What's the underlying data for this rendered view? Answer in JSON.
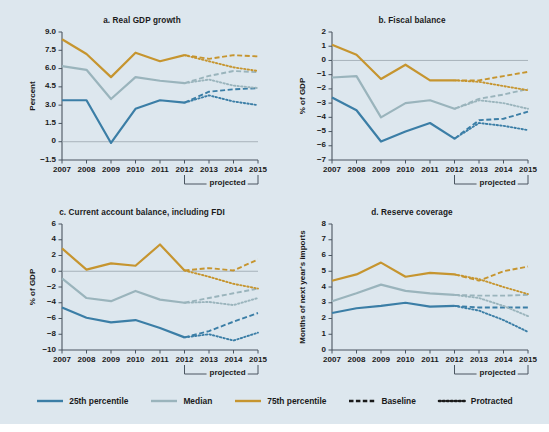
{
  "figure": {
    "background_color": "#dde7ee",
    "x_years": [
      2007,
      2008,
      2009,
      2010,
      2011,
      2012,
      2013,
      2014,
      2015
    ],
    "projected_label": "projected",
    "projected_span": [
      2012,
      2015
    ]
  },
  "colors": {
    "p25": "#3b7ea6",
    "median": "#9ab4bc",
    "p75": "#c6952f",
    "axis": "#4a5560",
    "zero_line": "#9aa6ae",
    "text": "#1a1a1a"
  },
  "legend": {
    "items": [
      {
        "label": "25th percentile",
        "style": "solid",
        "color_key": "p25",
        "color": "#3b7ea6"
      },
      {
        "label": "Median",
        "style": "solid",
        "color_key": "median",
        "color": "#9ab4bc"
      },
      {
        "label": "75th percentile",
        "style": "solid",
        "color_key": "p75",
        "color": "#c6952f"
      },
      {
        "label": "Baseline",
        "style": "dashed",
        "color_key": "black",
        "color": "#1a1a1a"
      },
      {
        "label": "Protracted",
        "style": "dotted",
        "color_key": "black",
        "color": "#1a1a1a"
      }
    ]
  },
  "chart_data": [
    {
      "id": "panel-a",
      "type": "line",
      "title": "a. Real GDP growth",
      "xlabel": "",
      "ylabel": "Percent",
      "x": [
        2007,
        2008,
        2009,
        2010,
        2011,
        2012,
        2013,
        2014,
        2015
      ],
      "ylim": [
        -1.5,
        9.0
      ],
      "yticks": [
        9.0,
        7.5,
        6.0,
        4.5,
        3.0,
        1.5,
        0,
        -1.5
      ],
      "yticklabels": [
        "9.0",
        "7.5",
        "6.0",
        "4.5",
        "3.0",
        "1.5",
        "0",
        "−1.5"
      ],
      "zero_line": 0,
      "grid": false,
      "series": [
        {
          "name": "25th percentile",
          "style": "solid",
          "color": "#3b7ea6",
          "x": [
            2007,
            2008,
            2009,
            2010,
            2011,
            2012
          ],
          "values": [
            3.4,
            3.4,
            -0.1,
            2.7,
            3.4,
            3.2
          ]
        },
        {
          "name": "Median",
          "style": "solid",
          "color": "#9ab4bc",
          "x": [
            2007,
            2008,
            2009,
            2010,
            2011,
            2012
          ],
          "values": [
            6.2,
            5.9,
            3.5,
            5.3,
            5.0,
            4.8
          ]
        },
        {
          "name": "75th percentile",
          "style": "solid",
          "color": "#c6952f",
          "x": [
            2007,
            2008,
            2009,
            2010,
            2011,
            2012
          ],
          "values": [
            8.4,
            7.2,
            5.3,
            7.3,
            6.6,
            7.1
          ]
        },
        {
          "name": "25th percentile - Baseline",
          "style": "dashed",
          "color": "#3b7ea6",
          "x": [
            2012,
            2013,
            2014,
            2015
          ],
          "values": [
            3.2,
            4.1,
            4.3,
            4.4
          ]
        },
        {
          "name": "25th percentile - Protracted",
          "style": "dotted",
          "color": "#3b7ea6",
          "x": [
            2012,
            2013,
            2014,
            2015
          ],
          "values": [
            3.2,
            3.8,
            3.3,
            3.0
          ]
        },
        {
          "name": "Median - Baseline",
          "style": "dashed",
          "color": "#9ab4bc",
          "x": [
            2012,
            2013,
            2014,
            2015
          ],
          "values": [
            4.8,
            5.4,
            5.8,
            5.7
          ]
        },
        {
          "name": "Median - Protracted",
          "style": "dotted",
          "color": "#9ab4bc",
          "x": [
            2012,
            2013,
            2014,
            2015
          ],
          "values": [
            4.8,
            5.1,
            4.6,
            4.4
          ]
        },
        {
          "name": "75th percentile - Baseline",
          "style": "dashed",
          "color": "#c6952f",
          "x": [
            2012,
            2013,
            2014,
            2015
          ],
          "values": [
            7.1,
            6.8,
            7.1,
            7.0
          ]
        },
        {
          "name": "75th percentile - Protracted",
          "style": "dotted",
          "color": "#c6952f",
          "x": [
            2012,
            2013,
            2014,
            2015
          ],
          "values": [
            7.1,
            6.6,
            6.1,
            5.8
          ]
        }
      ]
    },
    {
      "id": "panel-b",
      "type": "line",
      "title": "b. Fiscal balance",
      "xlabel": "",
      "ylabel": "% of GDP",
      "x": [
        2007,
        2008,
        2009,
        2010,
        2011,
        2012,
        2013,
        2014,
        2015
      ],
      "ylim": [
        -7,
        2
      ],
      "yticks": [
        2,
        1,
        0,
        -1,
        -2,
        -3,
        -4,
        -5,
        -6,
        -7
      ],
      "yticklabels": [
        "2",
        "1",
        "0",
        "−1",
        "−2",
        "−3",
        "−4",
        "−5",
        "−6",
        "−7"
      ],
      "zero_line": 0,
      "grid": false,
      "series": [
        {
          "name": "25th percentile",
          "style": "solid",
          "color": "#3b7ea6",
          "x": [
            2007,
            2008,
            2009,
            2010,
            2011,
            2012
          ],
          "values": [
            -2.6,
            -3.5,
            -5.7,
            -5.0,
            -4.4,
            -5.5
          ]
        },
        {
          "name": "Median",
          "style": "solid",
          "color": "#9ab4bc",
          "x": [
            2007,
            2008,
            2009,
            2010,
            2011,
            2012
          ],
          "values": [
            -1.2,
            -1.1,
            -4.0,
            -3.0,
            -2.8,
            -3.4
          ]
        },
        {
          "name": "75th percentile",
          "style": "solid",
          "color": "#c6952f",
          "x": [
            2007,
            2008,
            2009,
            2010,
            2011,
            2012
          ],
          "values": [
            1.1,
            0.4,
            -1.3,
            -0.3,
            -1.4,
            -1.4
          ]
        },
        {
          "name": "25th percentile - Baseline",
          "style": "dashed",
          "color": "#3b7ea6",
          "x": [
            2012,
            2013,
            2014,
            2015
          ],
          "values": [
            -5.5,
            -4.2,
            -4.1,
            -3.6
          ]
        },
        {
          "name": "25th percentile - Protracted",
          "style": "dotted",
          "color": "#3b7ea6",
          "x": [
            2012,
            2013,
            2014,
            2015
          ],
          "values": [
            -5.5,
            -4.4,
            -4.6,
            -4.9
          ]
        },
        {
          "name": "Median - Baseline",
          "style": "dashed",
          "color": "#9ab4bc",
          "x": [
            2012,
            2013,
            2014,
            2015
          ],
          "values": [
            -3.4,
            -2.7,
            -2.4,
            -2.0
          ]
        },
        {
          "name": "Median - Protracted",
          "style": "dotted",
          "color": "#9ab4bc",
          "x": [
            2012,
            2013,
            2014,
            2015
          ],
          "values": [
            -3.4,
            -2.8,
            -3.0,
            -3.4
          ]
        },
        {
          "name": "75th percentile - Baseline",
          "style": "dashed",
          "color": "#c6952f",
          "x": [
            2012,
            2013,
            2014,
            2015
          ],
          "values": [
            -1.4,
            -1.4,
            -1.1,
            -0.8
          ]
        },
        {
          "name": "75th percentile - Protracted",
          "style": "dotted",
          "color": "#c6952f",
          "x": [
            2012,
            2013,
            2014,
            2015
          ],
          "values": [
            -1.4,
            -1.5,
            -1.8,
            -2.1
          ]
        }
      ]
    },
    {
      "id": "panel-c",
      "type": "line",
      "title": "c. Current account balance, including FDI",
      "xlabel": "",
      "ylabel": "% of GDP",
      "x": [
        2007,
        2008,
        2009,
        2010,
        2011,
        2012,
        2013,
        2014,
        2015
      ],
      "ylim": [
        -10,
        6
      ],
      "yticks": [
        6,
        4,
        2,
        0,
        -2,
        -4,
        -6,
        -8,
        -10
      ],
      "yticklabels": [
        "6",
        "4",
        "2",
        "0",
        "−2",
        "−4",
        "−6",
        "−8",
        "−10"
      ],
      "zero_line": 0,
      "grid": false,
      "series": [
        {
          "name": "25th percentile",
          "style": "solid",
          "color": "#3b7ea6",
          "x": [
            2007,
            2008,
            2009,
            2010,
            2011,
            2012
          ],
          "values": [
            -4.6,
            -5.9,
            -6.5,
            -6.2,
            -7.2,
            -8.4
          ]
        },
        {
          "name": "Median",
          "style": "solid",
          "color": "#9ab4bc",
          "x": [
            2007,
            2008,
            2009,
            2010,
            2011,
            2012
          ],
          "values": [
            -0.9,
            -3.4,
            -3.8,
            -2.5,
            -3.6,
            -4.0
          ]
        },
        {
          "name": "75th percentile",
          "style": "solid",
          "color": "#c6952f",
          "x": [
            2007,
            2008,
            2009,
            2010,
            2011,
            2012
          ],
          "values": [
            2.9,
            0.2,
            1.0,
            0.7,
            3.4,
            0.1
          ]
        },
        {
          "name": "25th percentile - Baseline",
          "style": "dashed",
          "color": "#3b7ea6",
          "x": [
            2012,
            2013,
            2014,
            2015
          ],
          "values": [
            -8.4,
            -7.6,
            -6.4,
            -5.3
          ]
        },
        {
          "name": "25th percentile - Protracted",
          "style": "dotted",
          "color": "#3b7ea6",
          "x": [
            2012,
            2013,
            2014,
            2015
          ],
          "values": [
            -8.4,
            -8.0,
            -8.8,
            -7.8
          ]
        },
        {
          "name": "Median - Baseline",
          "style": "dashed",
          "color": "#9ab4bc",
          "x": [
            2012,
            2013,
            2014,
            2015
          ],
          "values": [
            -4.0,
            -3.4,
            -2.8,
            -2.2
          ]
        },
        {
          "name": "Median - Protracted",
          "style": "dotted",
          "color": "#9ab4bc",
          "x": [
            2012,
            2013,
            2014,
            2015
          ],
          "values": [
            -4.0,
            -3.9,
            -4.3,
            -3.4
          ]
        },
        {
          "name": "75th percentile - Baseline",
          "style": "dashed",
          "color": "#c6952f",
          "x": [
            2012,
            2013,
            2014,
            2015
          ],
          "values": [
            0.1,
            0.4,
            0.1,
            1.5
          ]
        },
        {
          "name": "75th percentile - Protracted",
          "style": "dotted",
          "color": "#c6952f",
          "x": [
            2012,
            2013,
            2014,
            2015
          ],
          "values": [
            0.1,
            -0.7,
            -1.6,
            -2.2
          ]
        }
      ]
    },
    {
      "id": "panel-d",
      "type": "line",
      "title": "d. Reserve coverage",
      "xlabel": "",
      "ylabel": "Months of next year's imports",
      "x": [
        2007,
        2008,
        2009,
        2010,
        2011,
        2012,
        2013,
        2014,
        2015
      ],
      "ylim": [
        0,
        8
      ],
      "yticks": [
        8,
        7,
        6,
        5,
        4,
        3,
        2,
        1,
        0
      ],
      "yticklabels": [
        "8",
        "7",
        "6",
        "5",
        "4",
        "3",
        "2",
        "1",
        "0"
      ],
      "zero_line": null,
      "grid": false,
      "series": [
        {
          "name": "25th percentile",
          "style": "solid",
          "color": "#3b7ea6",
          "x": [
            2007,
            2008,
            2009,
            2010,
            2011,
            2012
          ],
          "values": [
            2.35,
            2.65,
            2.8,
            3.0,
            2.75,
            2.8
          ]
        },
        {
          "name": "Median",
          "style": "solid",
          "color": "#9ab4bc",
          "x": [
            2007,
            2008,
            2009,
            2010,
            2011,
            2012
          ],
          "values": [
            3.1,
            3.6,
            4.15,
            3.75,
            3.6,
            3.5
          ]
        },
        {
          "name": "75th percentile",
          "style": "solid",
          "color": "#c6952f",
          "x": [
            2007,
            2008,
            2009,
            2010,
            2011,
            2012
          ],
          "values": [
            4.4,
            4.8,
            5.55,
            4.65,
            4.9,
            4.8
          ]
        },
        {
          "name": "25th percentile - Baseline",
          "style": "dashed",
          "color": "#3b7ea6",
          "x": [
            2012,
            2013,
            2014,
            2015
          ],
          "values": [
            2.8,
            2.7,
            2.7,
            2.7
          ]
        },
        {
          "name": "25th percentile - Protracted",
          "style": "dotted",
          "color": "#3b7ea6",
          "x": [
            2012,
            2013,
            2014,
            2015
          ],
          "values": [
            2.8,
            2.5,
            1.9,
            1.15
          ]
        },
        {
          "name": "Median - Baseline",
          "style": "dashed",
          "color": "#9ab4bc",
          "x": [
            2012,
            2013,
            2014,
            2015
          ],
          "values": [
            3.5,
            3.45,
            3.45,
            3.5
          ]
        },
        {
          "name": "Median - Protracted",
          "style": "dotted",
          "color": "#9ab4bc",
          "x": [
            2012,
            2013,
            2014,
            2015
          ],
          "values": [
            3.5,
            3.3,
            2.8,
            2.15
          ]
        },
        {
          "name": "75th percentile - Baseline",
          "style": "dashed",
          "color": "#c6952f",
          "x": [
            2012,
            2013,
            2014,
            2015
          ],
          "values": [
            4.8,
            4.4,
            5.0,
            5.3
          ]
        },
        {
          "name": "75th percentile - Protracted",
          "style": "dotted",
          "color": "#c6952f",
          "x": [
            2012,
            2013,
            2014,
            2015
          ],
          "values": [
            4.8,
            4.5,
            4.0,
            3.55
          ]
        }
      ]
    }
  ]
}
